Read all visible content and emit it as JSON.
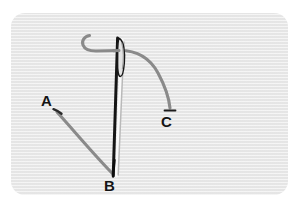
{
  "figure": {
    "kind": "sewing-needle-thread-diagram",
    "background_color": "#ffffff",
    "panel_color": "#e8e8e8",
    "needle_color": "#1a1a1a",
    "needle_highlight_color": "#f2f2f2",
    "needle_shadow_color": "#9a9a9a",
    "thread_color": "#8a8a8a",
    "label_color": "#141414"
  },
  "labels": {
    "a": "A",
    "b": "B",
    "c": "C"
  },
  "parts": {
    "needle": "sewing-needle",
    "needle_eye": "needle-eye",
    "needle_tip": "needle-tip",
    "thread_left_tail": "thread-tail-to-a",
    "thread_hook": "thread-hook-curl",
    "thread_right_tail": "thread-tail-to-c"
  },
  "geometry": {
    "panel": {
      "x": 11,
      "y": 13,
      "width": 277,
      "height": 182,
      "radius": 14
    },
    "needle_top": {
      "x": 119,
      "y": 36
    },
    "needle_bottom": {
      "x": 113,
      "y": 176
    },
    "point_a": {
      "x": 53,
      "y": 110
    },
    "point_b": {
      "x": 113,
      "y": 176
    },
    "point_c": {
      "x": 170,
      "y": 110
    }
  }
}
